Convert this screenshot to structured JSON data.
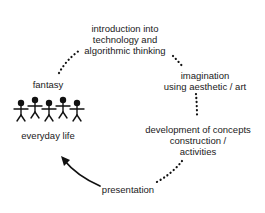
{
  "diagram": {
    "type": "cycle",
    "nodes": {
      "introduction": {
        "lines": [
          "introduction into",
          "technology and",
          "algorithmic thinking"
        ]
      },
      "imagination": {
        "lines": [
          "imagination",
          "using aesthetic / art"
        ]
      },
      "development": {
        "lines": [
          "development of concepts",
          "construction /",
          "activities"
        ]
      },
      "presentation": {
        "lines": [
          "presentation"
        ]
      },
      "everyday_life": {
        "lines": [
          "everyday life"
        ],
        "icon": "group-of-people-icon",
        "figure_count": 5
      },
      "fantasy": {
        "lines": [
          "fantasy"
        ]
      }
    },
    "edges": [
      {
        "from": "fantasy",
        "to": "introduction",
        "style": "dotted"
      },
      {
        "from": "introduction",
        "to": "imagination",
        "style": "dotted"
      },
      {
        "from": "imagination",
        "to": "development",
        "style": "dotted"
      },
      {
        "from": "development",
        "to": "presentation",
        "style": "dotted"
      },
      {
        "from": "presentation",
        "to": "everyday_life",
        "style": "solid-arrow"
      }
    ],
    "colors": {
      "text": "#1a1a1a",
      "lines": "#111111",
      "background": "#ffffff"
    }
  }
}
